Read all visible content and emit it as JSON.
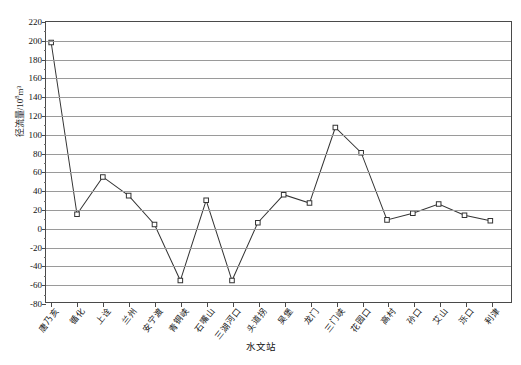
{
  "chart_data": {
    "type": "line",
    "title": "",
    "xlabel": "水文站",
    "ylabel": "径流量/10⁸m³",
    "ylabel_main": "径流量/10",
    "ylabel_exp": "8",
    "ylabel_unit": "m³",
    "ylim": [
      -80,
      220
    ],
    "ystep": 20,
    "grid": true,
    "legend": "none",
    "marker": "open-square",
    "line_color": "#333333",
    "grid_color": "#9a9a9a",
    "categories": [
      "唐乃亥",
      "循化",
      "上诠",
      "兰州",
      "安宁渡",
      "青铜峡",
      "石嘴山",
      "三湖河口",
      "头道拐",
      "吴堡",
      "龙门",
      "三门峡",
      "花园口",
      "高村",
      "孙口",
      "艾山",
      "泺口",
      "利津"
    ],
    "values": [
      198,
      14,
      54,
      34,
      3,
      -57,
      29,
      -57,
      5,
      35,
      26,
      107,
      80,
      8,
      15,
      25,
      13,
      7
    ],
    "yticks": [
      220,
      200,
      180,
      160,
      140,
      120,
      100,
      80,
      60,
      40,
      20,
      0,
      -20,
      -40,
      -60,
      -80
    ],
    "ytick_labels": [
      "220",
      "200",
      "180",
      "160",
      "140",
      "120",
      "100",
      "80",
      "60",
      "40",
      "20",
      "0",
      "-20",
      "-40",
      "-60",
      "-80"
    ]
  }
}
